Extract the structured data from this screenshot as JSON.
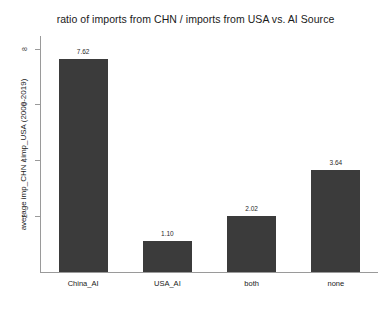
{
  "chart_data": {
    "type": "bar",
    "title": "ratio of imports from CHN / imports from USA vs. AI Source",
    "xlabel": "",
    "ylabel": "average imp_CHN / imp_USA (2000-2019)",
    "categories": [
      "China_AI",
      "USA_AI",
      "both",
      "none"
    ],
    "values": [
      7.62,
      1.1,
      2.02,
      3.64
    ],
    "value_labels": [
      "7.62",
      "1.10",
      "2.02",
      "3.64"
    ],
    "ylim": [
      0,
      8.45
    ],
    "yticks": [
      2,
      4,
      6,
      8
    ],
    "ytick_labels": [
      "2",
      "4",
      "6",
      "8"
    ],
    "grid": false,
    "legend": false,
    "bar_color": "#3b3b3b",
    "background_color": "#ffffff",
    "axis_color": "#9a9a9a"
  }
}
